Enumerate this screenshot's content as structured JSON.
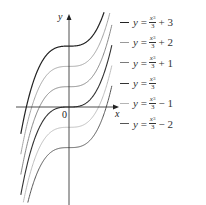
{
  "chart_data": {
    "type": "line",
    "title": "",
    "xlabel": "x",
    "ylabel": "y",
    "origin_label": "0",
    "grid": false,
    "legend_position": "right",
    "xlim": [
      -2.3,
      2.3
    ],
    "ylim": [
      -4.4,
      4.7
    ],
    "series": [
      {
        "name": "y = x^3/3 + 3",
        "c": 3,
        "color": "#222222",
        "width": 1.2
      },
      {
        "name": "y = x^3/3 + 2",
        "c": 2,
        "color": "#9a9a9a",
        "width": 0.9
      },
      {
        "name": "y = x^3/3 + 1",
        "c": 1,
        "color": "#7a7a7a",
        "width": 0.9
      },
      {
        "name": "y = x^3/3",
        "c": 0,
        "color": "#333333",
        "width": 1.1
      },
      {
        "name": "y = x^3/3 - 1",
        "c": -1,
        "color": "#b5b5b5",
        "width": 0.9
      },
      {
        "name": "y = x^3/3 - 2",
        "c": -2,
        "color": "#555555",
        "width": 1.0
      }
    ]
  },
  "legend": [
    {
      "lhs": "y",
      "eq": "=",
      "num": "x",
      "exp": "3",
      "den": "3",
      "tail": "+ 3"
    },
    {
      "lhs": "y",
      "eq": "=",
      "num": "x",
      "exp": "3",
      "den": "3",
      "tail": "+ 2"
    },
    {
      "lhs": "y",
      "eq": "=",
      "num": "x",
      "exp": "3",
      "den": "3",
      "tail": "+ 1"
    },
    {
      "lhs": "y",
      "eq": "=",
      "num": "x",
      "exp": "3",
      "den": "3",
      "tail": ""
    },
    {
      "lhs": "y",
      "eq": "=",
      "num": "x",
      "exp": "3",
      "den": "3",
      "tail": "− 1"
    },
    {
      "lhs": "y",
      "eq": "=",
      "num": "x",
      "exp": "3",
      "den": "3",
      "tail": "− 2"
    }
  ]
}
